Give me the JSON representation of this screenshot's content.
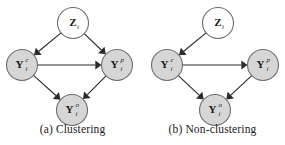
{
  "figure": {
    "background_color": "#ffffff",
    "node_fill_observed": "#d6d6d6",
    "node_fill_latent": "#ffffff",
    "node_stroke": "#6e6e6e",
    "edge_color": "#2b2b2b",
    "panels": [
      {
        "id": "clustering",
        "caption": "(a) Clustering",
        "caption_index": "(a)",
        "caption_text": "Clustering",
        "nodes": [
          {
            "id": "Z",
            "base": "Z",
            "sup": "",
            "sub": "i",
            "style": "latent",
            "cx": 73,
            "cy": 23
          },
          {
            "id": "Yc",
            "base": "Y",
            "sup": "c",
            "sub": "i",
            "style": "observed",
            "cx": 22,
            "cy": 65
          },
          {
            "id": "Yp",
            "base": "Y",
            "sup": "p",
            "sub": "i",
            "style": "observed",
            "cx": 117,
            "cy": 65
          },
          {
            "id": "Yo",
            "base": "Y",
            "sup": "o",
            "sub": "i",
            "style": "observed",
            "cx": 72,
            "cy": 110
          }
        ],
        "edges": [
          {
            "from": "Z",
            "to": "Yc"
          },
          {
            "from": "Z",
            "to": "Yp"
          },
          {
            "from": "Yc",
            "to": "Yp"
          },
          {
            "from": "Yc",
            "to": "Yo"
          },
          {
            "from": "Yp",
            "to": "Yo"
          }
        ]
      },
      {
        "id": "nonclustering",
        "caption": "(b) Non-clustering",
        "caption_index": "(b)",
        "caption_text": "Non-clustering",
        "nodes": [
          {
            "id": "Z",
            "base": "Z",
            "sup": "",
            "sub": "i",
            "style": "latent",
            "cx": 78,
            "cy": 23
          },
          {
            "id": "Yc",
            "base": "Y",
            "sup": "c",
            "sub": "i",
            "style": "observed",
            "cx": 27,
            "cy": 65
          },
          {
            "id": "Yp",
            "base": "Y",
            "sup": "p",
            "sub": "i",
            "style": "observed",
            "cx": 123,
            "cy": 65
          },
          {
            "id": "Yo",
            "base": "Y",
            "sup": "o",
            "sub": "i",
            "style": "observed",
            "cx": 75,
            "cy": 110
          }
        ],
        "edges": [
          {
            "from": "Z",
            "to": "Yc"
          },
          {
            "from": "Yc",
            "to": "Yp"
          },
          {
            "from": "Yc",
            "to": "Yo"
          },
          {
            "from": "Yp",
            "to": "Yo"
          }
        ]
      }
    ]
  }
}
